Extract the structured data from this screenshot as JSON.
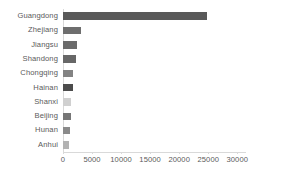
{
  "chart_data": {
    "type": "bar",
    "orientation": "horizontal",
    "title": "",
    "xlabel": "",
    "ylabel": "",
    "categories": [
      "Guangdong",
      "Zhejiang",
      "Jiangsu",
      "Shandong",
      "Chongqing",
      "Hainan",
      "Shanxi",
      "Beijing",
      "Hunan",
      "Anhui"
    ],
    "values": [
      24800,
      3050,
      2350,
      2200,
      1700,
      1700,
      1300,
      1300,
      1250,
      1100
    ],
    "bar_colors": [
      "#595959",
      "#6e6e6e",
      "#6b6b6b",
      "#676767",
      "#838383",
      "#4c4c4c",
      "#d0d0d0",
      "#767676",
      "#8a8a8a",
      "#b3b3b3"
    ],
    "xlim": [
      0,
      31500
    ],
    "xticks": [
      0,
      5000,
      10000,
      15000,
      20000,
      25000,
      30000
    ],
    "xtick_labels": [
      "0",
      "5000",
      "10000",
      "15000",
      "20000",
      "25000",
      "30000"
    ],
    "grid": false,
    "legend": null,
    "axis_color": "#d9d9d9",
    "text_color": "#5a5a5a",
    "background": "#ffffff"
  }
}
